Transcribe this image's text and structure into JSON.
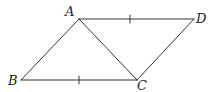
{
  "diagram": {
    "type": "parallelogram",
    "stroke_color": "#333333",
    "vertices": [
      {
        "id": "A",
        "label": "A",
        "x": 79,
        "y": 19,
        "label_x": 65,
        "label_y": 16
      },
      {
        "id": "D",
        "label": "D",
        "x": 194,
        "y": 19,
        "label_x": 196,
        "label_y": 23
      },
      {
        "id": "B",
        "label": "B",
        "x": 21,
        "y": 80,
        "label_x": 8,
        "label_y": 85
      },
      {
        "id": "C",
        "label": "C",
        "x": 137,
        "y": 80,
        "label_x": 137,
        "label_y": 90
      }
    ],
    "segments": [
      {
        "from": "A",
        "to": "D",
        "tick": true
      },
      {
        "from": "B",
        "to": "C",
        "tick": true
      },
      {
        "from": "A",
        "to": "B",
        "tick": false
      },
      {
        "from": "C",
        "to": "D",
        "tick": false
      },
      {
        "from": "A",
        "to": "C",
        "tick": false
      }
    ]
  }
}
